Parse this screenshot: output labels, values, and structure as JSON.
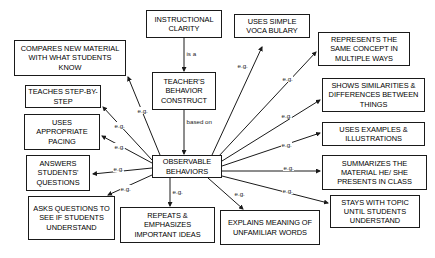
{
  "diagram": {
    "stroke_color": "#1a1a1a",
    "background_color": "#ffffff"
  },
  "nodes": {
    "instructional_clarity": "INSTRUCTIONAL CLARITY",
    "teachers_behavior_construct": "TEACHER'S BEHAVIOR CONSTRUCT",
    "observable_behaviors": "OBSERVABLE BEHAVIORS",
    "compares_new_material": "COMPARES NEW MATERIAL WITH WHAT STUDENTS KNOW",
    "teaches_step_by_step": "TEACHES STEP-BY-STEP",
    "uses_appropriate_pacing": "USES APPROPRIATE PACING",
    "answers_students_questions": "ANSWERS STUDENTS' QUESTIONS",
    "asks_questions_to_see": "ASKS QUESTIONS TO SEE IF STUDENTS UNDERSTAND",
    "repeats_emphasizes": "REPEATS & EMPHASIZES IMPORTANT IDEAS",
    "explains_meaning": "EXPLAINS MEANING OF UNFAMILIAR WORDS",
    "uses_simple_vocabulary": "USES SIMPLE VOCA BULARY",
    "represents_same_concept": "REPRESENTS THE SAME CONCEPT IN MULTIPLE WAYS",
    "shows_similarities": "SHOWS SIMILARITIES & DIFFERENCES BETWEEN THINGS",
    "uses_examples": "USES EXAMPLES & ILLUSTRATIONS",
    "summarizes_material": "SUMMARIZES THE MATERIAL HE/ SHE PRESENTS IN CLASS",
    "stays_with_topic": "STAYS WITH TOPIC UNTIL STUDENTS UNDERSTAND"
  },
  "edge_labels": {
    "is_a": "is a",
    "based_on_line1": "based",
    "based_on_line2": "on",
    "eg_compares": "e.g.",
    "eg_teaches": "e.g.",
    "eg_pacing": "e.g.",
    "eg_answers": "e.g.",
    "eg_asks": "e.g.",
    "eg_repeats": "e.g.",
    "eg_explains": "e.g.",
    "eg_vocabulary": "e.g.",
    "eg_represents": "e.g.",
    "eg_similarities": "e.g.",
    "eg_examples": "e.g.",
    "eg_summarizes": "e.g.",
    "eg_stays": "e.g."
  },
  "relations": [
    {
      "from": "instructional_clarity",
      "to": "teachers_behavior_construct",
      "label": "is a"
    },
    {
      "from": "teachers_behavior_construct",
      "to": "observable_behaviors",
      "label": "based on"
    },
    {
      "from": "observable_behaviors",
      "to": "compares_new_material",
      "label": "e.g."
    },
    {
      "from": "observable_behaviors",
      "to": "teaches_step_by_step",
      "label": "e.g."
    },
    {
      "from": "observable_behaviors",
      "to": "uses_appropriate_pacing",
      "label": "e.g."
    },
    {
      "from": "observable_behaviors",
      "to": "answers_students_questions",
      "label": "e.g."
    },
    {
      "from": "observable_behaviors",
      "to": "asks_questions_to_see",
      "label": "e.g."
    },
    {
      "from": "observable_behaviors",
      "to": "repeats_emphasizes",
      "label": "e.g."
    },
    {
      "from": "observable_behaviors",
      "to": "explains_meaning",
      "label": "e.g."
    },
    {
      "from": "observable_behaviors",
      "to": "uses_simple_vocabulary",
      "label": "e.g."
    },
    {
      "from": "observable_behaviors",
      "to": "represents_same_concept",
      "label": "e.g."
    },
    {
      "from": "observable_behaviors",
      "to": "shows_similarities",
      "label": "e.g."
    },
    {
      "from": "observable_behaviors",
      "to": "uses_examples",
      "label": "e.g."
    },
    {
      "from": "observable_behaviors",
      "to": "summarizes_material",
      "label": "e.g."
    },
    {
      "from": "observable_behaviors",
      "to": "stays_with_topic",
      "label": "e.g."
    }
  ]
}
